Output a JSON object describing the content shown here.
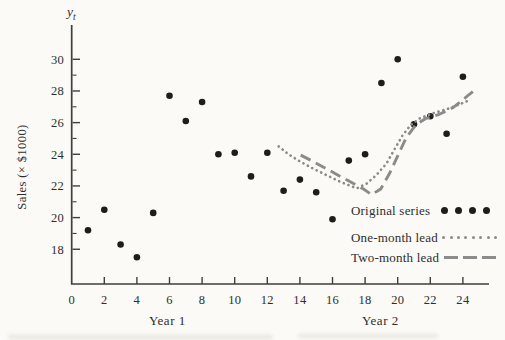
{
  "chart_data": {
    "type": "scatter",
    "title": "",
    "ylabel": "Sales (× $1000)",
    "y_axis_symbol": {
      "base": "y",
      "sub": "t"
    },
    "x_group_labels": [
      "Year 1",
      "Year 2"
    ],
    "x_ticks": [
      0,
      2,
      4,
      6,
      8,
      10,
      12,
      14,
      16,
      18,
      20,
      22,
      24
    ],
    "y_ticks": [
      18,
      20,
      22,
      24,
      26,
      28,
      30
    ],
    "y_minor_ticks": [
      19,
      21,
      23,
      25,
      27,
      29
    ],
    "xlim": [
      0,
      25.6
    ],
    "ylim": [
      16.4,
      32.2
    ],
    "grid": false,
    "legend_position": "lower-right-inside",
    "series": [
      {
        "name": "Original series",
        "style": "points",
        "x": [
          1,
          2,
          3,
          4,
          5,
          6,
          7,
          8,
          9,
          10,
          11,
          12,
          13,
          14,
          15,
          16,
          17,
          18,
          19,
          20,
          21,
          22,
          23,
          24
        ],
        "values": [
          19.2,
          20.5,
          18.3,
          17.5,
          20.3,
          27.7,
          26.1,
          27.3,
          24.0,
          24.1,
          22.6,
          24.1,
          21.7,
          22.4,
          21.6,
          19.9,
          23.6,
          24.0,
          28.5,
          30.0,
          25.9,
          26.4,
          25.3,
          28.9
        ]
      },
      {
        "name": "One-month lead",
        "style": "dotted",
        "points": [
          [
            12.7,
            24.5
          ],
          [
            13.3,
            24.0
          ],
          [
            14.0,
            23.55
          ],
          [
            14.8,
            23.1
          ],
          [
            15.6,
            22.7
          ],
          [
            16.4,
            22.3
          ],
          [
            17.1,
            22.0
          ],
          [
            17.5,
            21.85
          ],
          [
            18.1,
            22.15
          ],
          [
            18.7,
            22.7
          ],
          [
            19.3,
            23.4
          ],
          [
            19.8,
            24.3
          ],
          [
            20.3,
            25.2
          ],
          [
            20.8,
            25.85
          ],
          [
            21.4,
            26.3
          ],
          [
            22.2,
            26.6
          ],
          [
            23.0,
            26.85
          ],
          [
            23.8,
            27.15
          ],
          [
            24.35,
            27.4
          ]
        ]
      },
      {
        "name": "Two-month lead",
        "style": "dashed",
        "points": [
          [
            14.05,
            23.95
          ],
          [
            14.8,
            23.55
          ],
          [
            15.6,
            23.1
          ],
          [
            16.4,
            22.65
          ],
          [
            17.2,
            22.2
          ],
          [
            17.9,
            21.8
          ],
          [
            18.4,
            21.45
          ],
          [
            18.95,
            21.8
          ],
          [
            19.5,
            22.8
          ],
          [
            20.0,
            23.9
          ],
          [
            20.5,
            25.0
          ],
          [
            21.1,
            25.85
          ],
          [
            21.7,
            26.25
          ],
          [
            22.5,
            26.5
          ],
          [
            23.4,
            26.95
          ],
          [
            24.3,
            27.7
          ],
          [
            24.9,
            28.2
          ]
        ]
      }
    ],
    "colors": {
      "points": "#1d1d1d",
      "leads": "#8b8b8b",
      "axis": "#3f3f3f",
      "text": "#2e2e2e",
      "background": "#fbfaf6"
    }
  }
}
